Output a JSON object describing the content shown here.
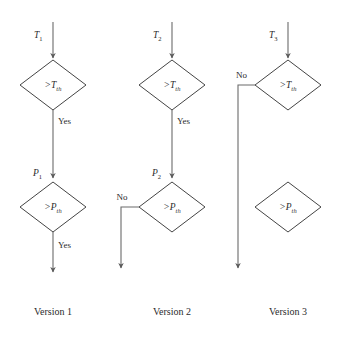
{
  "diagram": {
    "background_color": "#ffffff",
    "shape_stroke_color": "#444444",
    "connector_color": "#6b6b6b",
    "text_color": "#2b2b2b",
    "versions": [
      {
        "caption": "Version 1",
        "input_label": "T",
        "input_sub": "1",
        "decision_top": {
          "op": ">",
          "symbol": "T",
          "sub": "th"
        },
        "branch_top_label": "Yes",
        "mid_label": "P",
        "mid_sub": "1",
        "decision_bottom": {
          "op": ">",
          "symbol": "P",
          "sub": "th"
        },
        "branch_bottom_label": "Yes"
      },
      {
        "caption": "Version 2",
        "input_label": "T",
        "input_sub": "2",
        "decision_top": {
          "op": ">",
          "symbol": "T",
          "sub": "th"
        },
        "branch_top_label": "Yes",
        "mid_label": "P",
        "mid_sub": "2",
        "decision_bottom": {
          "op": ">",
          "symbol": "P",
          "sub": "th"
        },
        "branch_bottom_label": "No"
      },
      {
        "caption": "Version 3",
        "input_label": "T",
        "input_sub": "3",
        "decision_top": {
          "op": ">",
          "symbol": "T",
          "sub": "th"
        },
        "branch_top_label": "No",
        "decision_bottom": {
          "op": ">",
          "symbol": "P",
          "sub": "th"
        }
      }
    ]
  }
}
